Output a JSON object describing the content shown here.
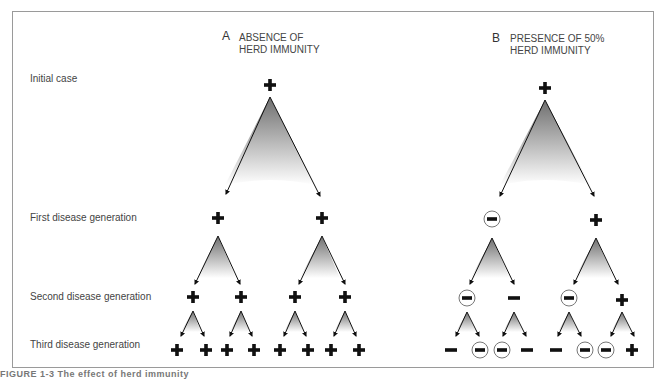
{
  "rows": {
    "initial": "Initial case",
    "first": "First disease generation",
    "second": "Second disease generation",
    "third": "Third disease generation"
  },
  "panels": {
    "a": {
      "letter": "A",
      "title_line1": "ABSENCE OF",
      "title_line2": "HERD IMMUNITY"
    },
    "b": {
      "letter": "B",
      "title_line1": "PRESENCE OF 50%",
      "title_line2": "HERD IMMUNITY"
    }
  },
  "tree_a": {
    "initial": "+",
    "first": [
      "+",
      "+"
    ],
    "second": [
      "+",
      "+",
      "+",
      "+"
    ],
    "third": [
      "+",
      "+",
      "+",
      "+",
      "+",
      "+",
      "+",
      "+"
    ]
  },
  "tree_b": {
    "initial": "+",
    "first": [
      "immune",
      "+"
    ],
    "second": [
      "immune",
      "-",
      "immune",
      "+"
    ],
    "third": [
      "-",
      "immune",
      "immune",
      "-",
      "-",
      "immune",
      "immune",
      "+"
    ]
  },
  "legend_semantics": {
    "+": "infected case",
    "-": "not infected",
    "immune": "immune (circled minus)"
  },
  "caption": "FIGURE 1-3 The effect of herd immunity"
}
